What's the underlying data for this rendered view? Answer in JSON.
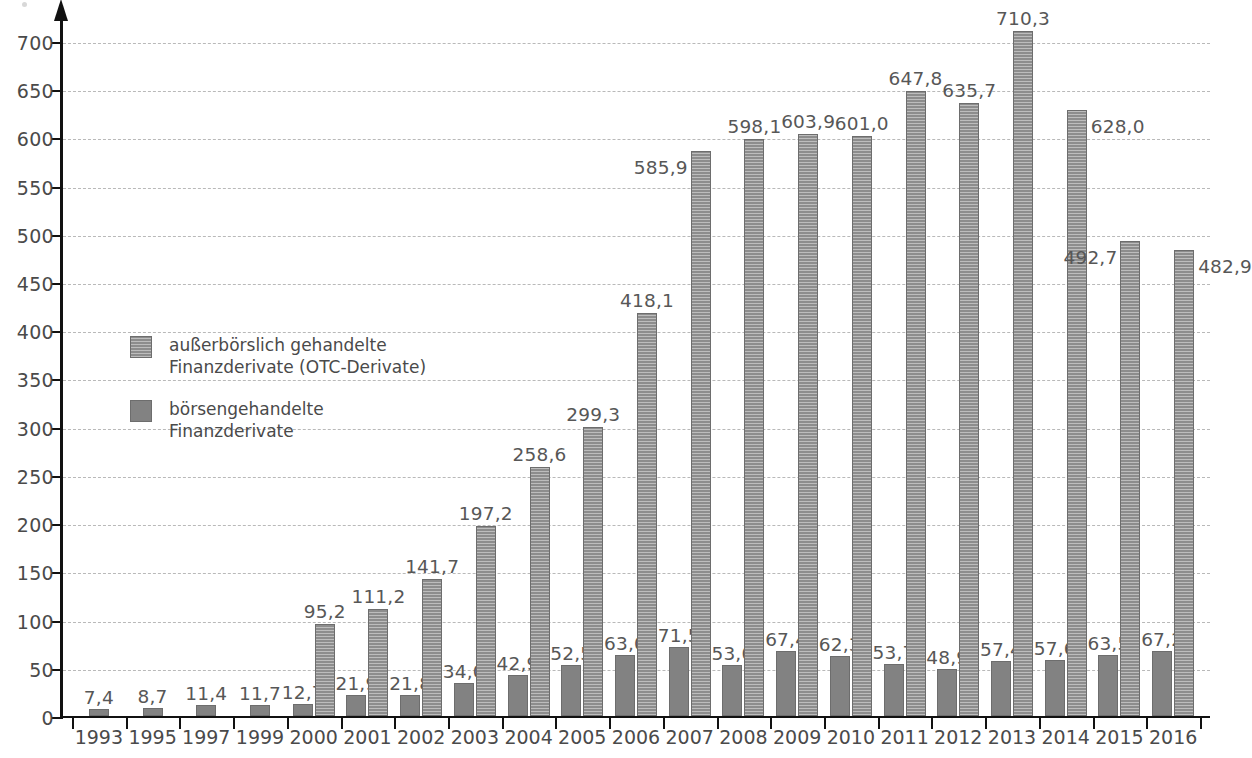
{
  "chart_data": {
    "type": "bar",
    "title": "",
    "subtitle": "",
    "xlabel": "",
    "ylabel": "",
    "ylim": [
      0,
      730
    ],
    "ytick_step": 50,
    "yticks": [
      0,
      50,
      100,
      150,
      200,
      250,
      300,
      350,
      400,
      450,
      500,
      550,
      600,
      650,
      700
    ],
    "ytick_labels": [
      "0",
      "50",
      "100",
      "150",
      "200",
      "250",
      "300",
      "350",
      "400",
      "450",
      "500",
      "550",
      "600",
      "650",
      "700"
    ],
    "grid": true,
    "grid_style": "dashed",
    "legend_position": "inside-left",
    "decimal_separator": ",",
    "categories": [
      "1993",
      "1995",
      "1997",
      "1999",
      "2000",
      "2001",
      "2002",
      "2003",
      "2004",
      "2005",
      "2006",
      "2007",
      "2008",
      "2009",
      "2010",
      "2011",
      "2012",
      "2013",
      "2014",
      "2015",
      "2016"
    ],
    "series": [
      {
        "name": "börsengehandelte Finanzderivate",
        "key": "exchange-traded",
        "fill": "solid",
        "color": "#828282",
        "values": [
          7.4,
          8.7,
          11.4,
          11.7,
          12.7,
          21.9,
          21.8,
          34.0,
          42.9,
          52.5,
          63.0,
          71.5,
          53.0,
          67.4,
          62.3,
          53.7,
          48.9,
          57.4,
          57.6,
          63.5,
          67.2
        ],
        "labels": [
          "7,4",
          "8,7",
          "11,4",
          "11,7",
          "12,7",
          "21,9",
          "21,8",
          "34,0",
          "42,9",
          "52,5",
          "63,0",
          "71,5",
          "53,0",
          "67,4",
          "62,3",
          "53,7",
          "48,9",
          "57,4",
          "57,6",
          "63,5",
          "67,2"
        ]
      },
      {
        "name": "außerbörslich gehandelte Finanzderivate (OTC-Derivate)",
        "key": "otc",
        "fill": "hatched",
        "color": "#8d8d8d",
        "values": [
          null,
          null,
          null,
          null,
          95.2,
          111.2,
          141.7,
          197.2,
          258.6,
          299.3,
          418.1,
          585.9,
          598.1,
          603.9,
          601.0,
          647.8,
          635.7,
          710.3,
          628.0,
          492.7,
          482.9
        ],
        "labels": [
          "",
          "",
          "",
          "",
          "95,2",
          "111,2",
          "141,7",
          "197,2",
          "258,6",
          "299,3",
          "418,1",
          "585,9",
          "598,1",
          "603,9",
          "601,0",
          "647,8",
          "635,7",
          "710,3",
          "628,0",
          "492,7",
          "482,9"
        ]
      }
    ]
  },
  "legend": {
    "items": [
      {
        "line1": "außerbörslich gehandelte",
        "line2": "Finanzderivate (OTC-Derivate)",
        "swatch": "otc"
      },
      {
        "line1": "börsengehandelte",
        "line2": "Finanzderivate",
        "swatch": "exchange-traded"
      }
    ]
  }
}
